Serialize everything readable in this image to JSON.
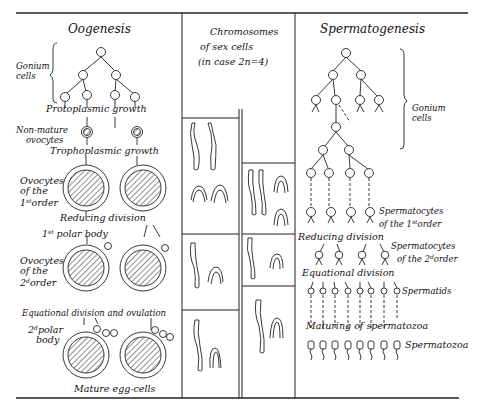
{
  "oogenesis": {
    "title": "Oogenesis",
    "gonium_label_1": "Gonium",
    "gonium_label_2": "cells",
    "protoplasmic_growth": "Protoplasmic growth",
    "nonmature_1": "Non-mature",
    "nonmature_2": "ovocytes",
    "trophoplasmic_growth": "Trophoplasmic growth",
    "ovocytes1_a": "Ovocytes",
    "ovocytes1_b": "of the",
    "ovocytes1_c_num": "1",
    "ovocytes1_c_sup": "st",
    "ovocytes1_c_rest": "order",
    "reducing_division": "Reducing division",
    "polar1_num": "1",
    "polar1_sup": "st",
    "polar1_rest": "polar body",
    "ovocytes2_a": "Ovocytes",
    "ovocytes2_b": "of the",
    "ovocytes2_c_num": "2",
    "ovocytes2_c_sup": "d",
    "ovocytes2_c_rest": "order",
    "equational_ovulation": "Equational division and ovulation",
    "polar2_num": "2",
    "polar2_sup": "d",
    "polar2_rest": "polar",
    "polar2_b": "body",
    "mature": "Mature egg-cells"
  },
  "chromosomes": {
    "title_1": "Chromosomes",
    "title_2": "of sex cells",
    "title_3": "(in case 2n=4)"
  },
  "spermatogenesis": {
    "title": "Spermatogenesis",
    "gonium_label_1": "Gonium",
    "gonium_label_2": "cells",
    "spermatocytes1_a": "Spermatocytes",
    "spermatocytes1_b_pre": "of the ",
    "spermatocytes1_b_num": "1",
    "spermatocytes1_b_sup": "st",
    "spermatocytes1_b_rest": "order",
    "reducing_division": "Reducing division",
    "spermatocytes2_a": "Spermatocytes",
    "spermatocytes2_b_pre": "of the ",
    "spermatocytes2_b_num": "2",
    "spermatocytes2_b_sup": "d",
    "spermatocytes2_b_rest": "order",
    "equational_division": "Equational division",
    "spermatids": "Spermatids",
    "maturing": "Maturing of spermatozoa",
    "spermatozoa": "Spermatozoa"
  }
}
